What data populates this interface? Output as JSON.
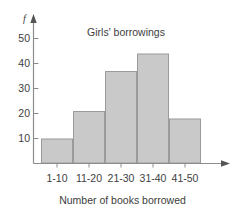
{
  "chart_data": {
    "type": "bar",
    "title": "Girls' borrowings",
    "xlabel": "Number of books borrowed",
    "ylabel": "f",
    "categories": [
      "1-10",
      "11-20",
      "21-30",
      "31-40",
      "41-50"
    ],
    "values": [
      10,
      21,
      37,
      44,
      18
    ],
    "yticks": [
      10,
      20,
      30,
      40,
      50
    ],
    "ylim": [
      0,
      55
    ],
    "grid": false,
    "legend": null,
    "bar_fill": "#c9c9c9",
    "bar_stroke": "#9a9a9a",
    "axis_color": "#8c8c8c",
    "text_color": "#3d3d3d",
    "background": "#ffffff",
    "axis_arrows": true
  },
  "figure": {
    "title": "Girls' borrowings",
    "x_axis_title": "Number of books borrowed",
    "y_axis_symbol": "f"
  }
}
